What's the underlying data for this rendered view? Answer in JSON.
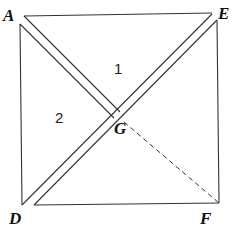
{
  "figure": {
    "type": "geometry-diagram",
    "points": {
      "A": {
        "label": "A",
        "x": 14,
        "y": 16
      },
      "E": {
        "label": "E",
        "x": 222,
        "y": 16
      },
      "D": {
        "label": "D",
        "x": 14,
        "y": 221
      },
      "F": {
        "label": "F",
        "x": 208,
        "y": 223
      },
      "G": {
        "label": "G",
        "x": 122,
        "y": 138
      }
    },
    "regions": [
      {
        "label": "1",
        "x": 116,
        "y": 74
      },
      {
        "label": "2",
        "x": 59,
        "y": 123
      }
    ],
    "segments": [
      {
        "name": "AE",
        "style": "solid"
      },
      {
        "name": "AD",
        "style": "solid"
      },
      {
        "name": "EF",
        "style": "solid"
      },
      {
        "name": "DF",
        "style": "solid"
      },
      {
        "name": "DE",
        "style": "double"
      },
      {
        "name": "AG",
        "style": "double"
      },
      {
        "name": "GF",
        "style": "dashed"
      }
    ],
    "colors": {
      "line": "#333333",
      "text": "#111111",
      "background": "#ffffff"
    }
  }
}
